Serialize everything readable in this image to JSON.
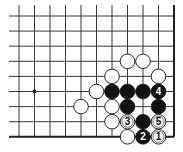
{
  "diagram": {
    "type": "go-board-fragment",
    "grid": {
      "columns": 11,
      "rows": 9,
      "x0": 19,
      "y0": 16,
      "dx": 15.5,
      "dy": 15.1,
      "line_start_x": 9,
      "line_start_y": 5,
      "right_edge": true,
      "bottom_edge": true
    },
    "star_points": [
      {
        "col": 1,
        "row": 5
      }
    ],
    "stones": [
      {
        "color": "white",
        "col": 7,
        "row": 3,
        "label": ""
      },
      {
        "color": "white",
        "col": 8,
        "row": 3,
        "label": ""
      },
      {
        "color": "white",
        "col": 6,
        "row": 4,
        "label": ""
      },
      {
        "color": "white",
        "col": 9,
        "row": 4,
        "label": ""
      },
      {
        "color": "white",
        "col": 5,
        "row": 5,
        "label": ""
      },
      {
        "color": "black",
        "col": 6,
        "row": 5,
        "label": ""
      },
      {
        "color": "black",
        "col": 7,
        "row": 5,
        "label": ""
      },
      {
        "color": "black",
        "col": 8,
        "row": 5,
        "label": ""
      },
      {
        "color": "black",
        "col": 9,
        "row": 5,
        "label": "4"
      },
      {
        "color": "white",
        "col": 4,
        "row": 6,
        "label": ""
      },
      {
        "color": "white",
        "col": 6,
        "row": 6,
        "label": ""
      },
      {
        "color": "black",
        "col": 7,
        "row": 6,
        "label": ""
      },
      {
        "color": "black",
        "col": 9,
        "row": 6,
        "label": ""
      },
      {
        "color": "white",
        "col": 6,
        "row": 7,
        "label": ""
      },
      {
        "color": "white",
        "col": 7,
        "row": 7,
        "label": "3"
      },
      {
        "color": "black",
        "col": 8,
        "row": 7,
        "label": ""
      },
      {
        "color": "white",
        "col": 9,
        "row": 7,
        "label": "5"
      },
      {
        "color": "white",
        "col": 7,
        "row": 8,
        "label": ""
      },
      {
        "color": "black",
        "col": 8,
        "row": 8,
        "label": "2"
      },
      {
        "color": "white",
        "col": 9,
        "row": 8,
        "label": "1"
      }
    ],
    "colors": {
      "line": "#222222",
      "black_stone": "#111111",
      "white_stone": "#ffffff",
      "stone_outline": "#111111"
    }
  }
}
